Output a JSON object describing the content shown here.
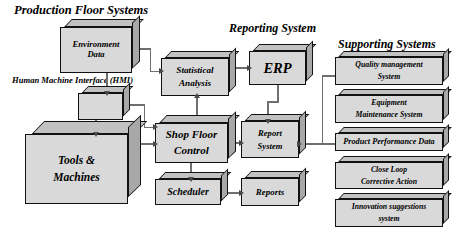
{
  "diagram": {
    "group_headers": [
      {
        "id": "production-floor-systems",
        "label": "Production Floor Systems"
      },
      {
        "id": "reporting-system",
        "label": "Reporting System"
      },
      {
        "id": "supporting-systems",
        "label": "Supporting Systems"
      }
    ],
    "side_labels": [
      {
        "id": "hmi-label",
        "label": "Human Machine\nInterface (HMI)"
      }
    ],
    "nodes": [
      {
        "id": "environment-data",
        "label": "Environment\nData",
        "group": "production-floor-systems"
      },
      {
        "id": "hmi",
        "label": "",
        "group": "production-floor-systems"
      },
      {
        "id": "tools-and-machines",
        "label": "Tools &\nMachines",
        "group": "production-floor-systems"
      },
      {
        "id": "statistical-analysis",
        "label": "Statistical\nAnalysis",
        "group": "production-floor-systems"
      },
      {
        "id": "shop-floor-control",
        "label": "Shop Floor\nControl",
        "group": "production-floor-systems"
      },
      {
        "id": "scheduler",
        "label": "Scheduler",
        "group": "production-floor-systems"
      },
      {
        "id": "erp",
        "label": "ERP",
        "group": "reporting-system"
      },
      {
        "id": "report-system",
        "label": "Report\nSystem",
        "group": "reporting-system"
      },
      {
        "id": "reports",
        "label": "Reports",
        "group": "reporting-system"
      },
      {
        "id": "quality-management-system",
        "label": "Quality management\nSystem",
        "group": "supporting-systems"
      },
      {
        "id": "equipment-maintenance-system",
        "label": "Equipment\nMaintenance System",
        "group": "supporting-systems"
      },
      {
        "id": "product-performance-data",
        "label": "Product Performance Data",
        "group": "supporting-systems"
      },
      {
        "id": "close-loop-corrective-action",
        "label": "Close Loop\nCorrective Action",
        "group": "supporting-systems"
      },
      {
        "id": "innovation-suggestions-system",
        "label": "Innovation suggestions\nsystem",
        "group": "supporting-systems"
      }
    ],
    "edges": [
      {
        "from": "environment-data",
        "to": "hmi"
      },
      {
        "from": "environment-data",
        "to": "statistical-analysis"
      },
      {
        "from": "hmi",
        "to": "tools-and-machines"
      },
      {
        "from": "hmi",
        "to": "shop-floor-control"
      },
      {
        "from": "tools-and-machines",
        "to": "shop-floor-control"
      },
      {
        "from": "shop-floor-control",
        "to": "statistical-analysis"
      },
      {
        "from": "shop-floor-control",
        "to": "scheduler"
      },
      {
        "from": "shop-floor-control",
        "to": "report-system"
      },
      {
        "from": "statistical-analysis",
        "to": "erp"
      },
      {
        "from": "erp",
        "to": "report-system"
      },
      {
        "from": "scheduler",
        "to": "reports"
      },
      {
        "from": "report-system",
        "to": "supporting-systems-bus"
      }
    ],
    "colors": {
      "box_face": "#d9d9d9",
      "box_top": "#c2c2c2",
      "box_side": "#a8a8a8",
      "outline": "#111111",
      "connector": "#6f6f6f",
      "background": "#ffffff"
    }
  }
}
